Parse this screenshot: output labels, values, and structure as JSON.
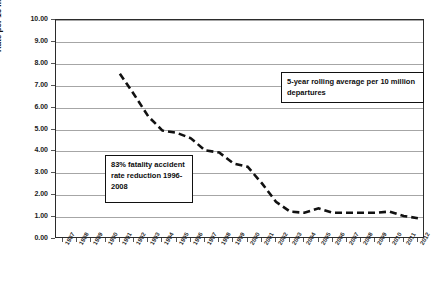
{
  "chart_data": {
    "type": "line",
    "title": "",
    "xlabel": "",
    "ylabel": "Rate per 10 million departures",
    "ylim": [
      0,
      10
    ],
    "ytick_step": 1,
    "grid": true,
    "legend_position": "inside-top-right",
    "ytick_labels": [
      "10.00",
      "9.00",
      "8.00",
      "7.00",
      "6.00",
      "5.00",
      "4.00",
      "3.00",
      "2.00",
      "1.00",
      "0.00"
    ],
    "categories": [
      "1987",
      "1988",
      "1989",
      "1990",
      "1991",
      "1992",
      "1993",
      "1994",
      "1995",
      "1996",
      "1997",
      "1998",
      "1999",
      "2000",
      "2001",
      "2002",
      "2003",
      "2004",
      "2005",
      "2006",
      "2007",
      "2008",
      "2009",
      "2010",
      "2011",
      "2012"
    ],
    "series": [
      {
        "name": "5-year rolling average per 10 million departures",
        "color": "#111111",
        "style": "dashed",
        "values": [
          null,
          null,
          null,
          null,
          7.55,
          6.6,
          5.6,
          4.95,
          4.85,
          4.6,
          4.05,
          3.95,
          3.45,
          3.3,
          2.55,
          1.7,
          1.25,
          1.2,
          1.4,
          1.2,
          1.2,
          1.2,
          1.2,
          1.25,
          1.05,
          0.95
        ]
      }
    ],
    "annotations": [
      {
        "id": "legend",
        "text": "5-year rolling average per 10 million departures"
      },
      {
        "id": "reduction",
        "text": "83% fatality accident rate reduction 1996-2008"
      }
    ]
  },
  "axes": {
    "y_title": "Rate per 10 million departures"
  }
}
